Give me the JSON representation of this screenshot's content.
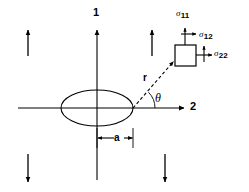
{
  "figure": {
    "stroke_color": "#000000",
    "background_color": "#ffffff"
  },
  "axes": {
    "vertical": {
      "label": "1",
      "x": 97,
      "y_top": 28,
      "y_bottom": 180
    },
    "horizontal": {
      "label": "2",
      "y": 108,
      "x_left": 18,
      "x_right": 185
    }
  },
  "hole": {
    "shape": "ellipse",
    "center_x": 97,
    "center_y": 108,
    "semi_major_a": 36,
    "semi_minor_b": 18
  },
  "dimension": {
    "label": "a",
    "from_x": 97,
    "to_x": 133,
    "y": 138
  },
  "polar": {
    "radius_label": "r",
    "angle_label": "θ",
    "origin_x": 133,
    "origin_y": 108,
    "point_x": 175,
    "point_y": 60
  },
  "stress_element": {
    "box": {
      "x": 175,
      "y": 45,
      "width": 21,
      "height": 21
    },
    "components": [
      {
        "name": "sigma-11",
        "symbol": "σ",
        "subscript": "11",
        "direction": "up"
      },
      {
        "name": "sigma-12",
        "symbol": "σ",
        "subscript": "12",
        "direction": "right"
      },
      {
        "name": "sigma-22",
        "symbol": "σ",
        "subscript": "22",
        "direction": "right"
      }
    ]
  },
  "remote_load_arrows": [
    {
      "name": "load-arrow-top-left",
      "x": 28,
      "direction": "up"
    },
    {
      "name": "load-arrow-top-right",
      "x": 152,
      "direction": "up"
    },
    {
      "name": "load-arrow-bottom-left",
      "x": 28,
      "direction": "down"
    },
    {
      "name": "load-arrow-bottom-right",
      "x": 165,
      "direction": "down"
    }
  ]
}
